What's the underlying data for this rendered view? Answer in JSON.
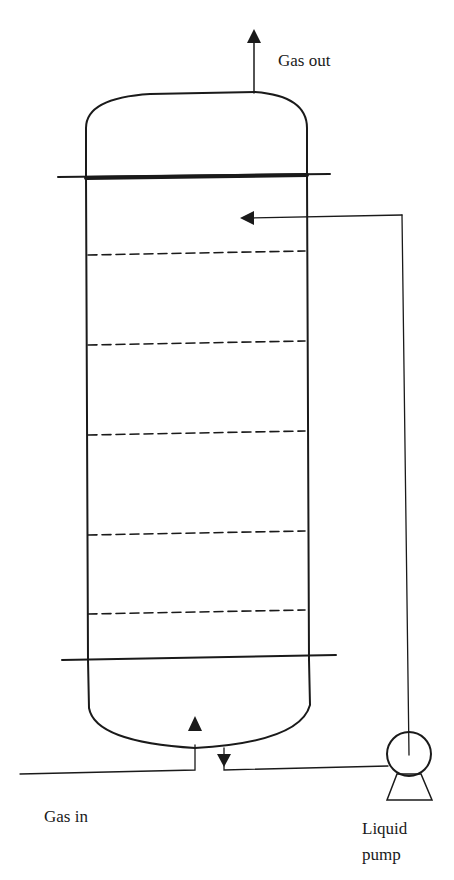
{
  "diagram": {
    "type": "absorption-column",
    "labels": {
      "gas_out": "Gas out",
      "gas_in": "Gas in",
      "pump_line1": "Liquid",
      "pump_line2": "pump"
    },
    "trays": [
      253,
      342,
      433,
      533,
      610
    ],
    "colors": {
      "ink": "#1a1a1a",
      "background": "#ffffff"
    }
  }
}
